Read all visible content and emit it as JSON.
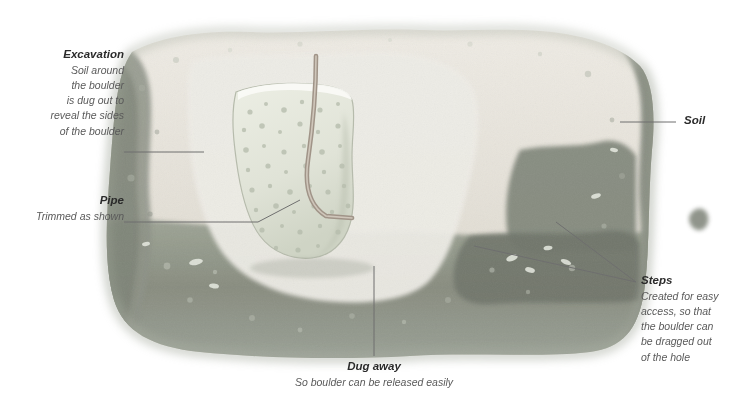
{
  "figure": {
    "type": "annotated-cross-section-illustration",
    "canvas": {
      "width": 747,
      "height": 416
    },
    "palette": {
      "topsoil_light": "#e8e4dd",
      "topsoil_mid": "#cfcac0",
      "subsoil_dark": "#8f9289",
      "subsoil_shadow": "#6f7468",
      "boulder_fill": "#e3e6dc",
      "boulder_speckle": "#b9bfae",
      "pipe": "#9a8f86",
      "leader_line": "#6f6f6f",
      "label_title": "#2b2b2b",
      "label_body": "#5a5a5a",
      "background": "#ffffff"
    }
  },
  "annotations": [
    {
      "id": "excavation",
      "title": "Excavation",
      "lines": [
        "Soil around",
        "the boulder",
        "is dug out to",
        "reveal the sides",
        "of the boulder"
      ],
      "align": "right"
    },
    {
      "id": "pipe",
      "title": "Pipe",
      "lines": [
        "Trimmed as shown"
      ],
      "align": "right"
    },
    {
      "id": "soil",
      "title": "Soil",
      "lines": [],
      "align": "left"
    },
    {
      "id": "steps",
      "title": "Steps",
      "lines": [
        "Created for easy",
        "access, so that",
        "the boulder can",
        "be dragged out",
        "of the hole"
      ],
      "align": "left"
    },
    {
      "id": "dug-away",
      "title": "Dug away",
      "lines": [
        "So boulder can be released easily"
      ],
      "align": "center"
    }
  ]
}
